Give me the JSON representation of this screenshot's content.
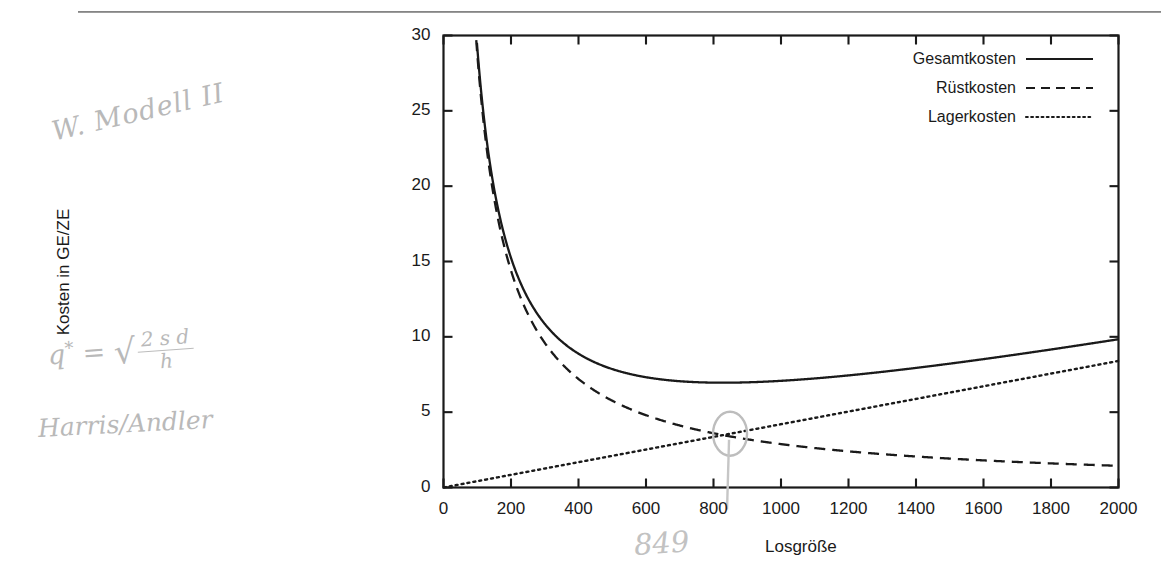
{
  "page": {
    "rule_visible": true
  },
  "annotations": {
    "model_note": "W. Modell II",
    "formula_lhs": "q",
    "formula_star": "*",
    "formula_eq": "=",
    "formula_radical": "√",
    "formula_numerator": "2 s d",
    "formula_denominator": "h",
    "authors": "Harris/Andler",
    "optimum_handwritten": "849"
  },
  "chart_data": {
    "type": "line",
    "title": "",
    "xlabel": "Losgröße",
    "ylabel": "Kosten in GE/ZE",
    "xlim": [
      0,
      2000
    ],
    "ylim": [
      0,
      30
    ],
    "xticks": [
      0,
      200,
      400,
      600,
      800,
      1000,
      1200,
      1400,
      1600,
      1800,
      2000
    ],
    "xtick_labels": [
      "0",
      "200",
      "400",
      "600",
      "800",
      "1000",
      "1200",
      "1400",
      "1600",
      "1800",
      "2000"
    ],
    "yticks": [
      0,
      5,
      10,
      15,
      20,
      25,
      30
    ],
    "ytick_labels": [
      "0",
      "5",
      "10",
      "15",
      "20",
      "25",
      "30"
    ],
    "grid": false,
    "legend_position": "top-right",
    "x": [
      100,
      200,
      300,
      400,
      500,
      600,
      700,
      800,
      849,
      900,
      1000,
      1100,
      1200,
      1300,
      1400,
      1500,
      1600,
      1700,
      1800,
      1900,
      2000
    ],
    "series": [
      {
        "name": "Gesamtkosten",
        "style": "solid",
        "color": "#1a1a1a",
        "formula": "s*d/q + h*q/2",
        "values": [
          29.22,
          15.24,
          10.86,
          8.88,
          7.86,
          7.32,
          7.05,
          6.96,
          6.96,
          6.98,
          7.08,
          7.24,
          7.44,
          7.67,
          7.94,
          8.22,
          8.52,
          8.84,
          9.16,
          9.5,
          9.84
        ]
      },
      {
        "name": "Rüstkosten",
        "style": "dashed",
        "color": "#1a1a1a",
        "formula": "s*d/q",
        "values": [
          28.8,
          14.4,
          9.6,
          7.2,
          5.76,
          4.8,
          4.11,
          3.6,
          3.39,
          3.2,
          2.88,
          2.62,
          2.4,
          2.22,
          2.06,
          1.92,
          1.8,
          1.69,
          1.6,
          1.52,
          1.44
        ]
      },
      {
        "name": "Lagerkosten",
        "style": "dotted",
        "color": "#1a1a1a",
        "formula": "h*q/2",
        "values": [
          0.42,
          0.84,
          1.26,
          1.68,
          2.1,
          2.52,
          2.94,
          3.36,
          3.57,
          3.78,
          4.2,
          4.62,
          5.04,
          5.46,
          5.88,
          6.3,
          6.72,
          7.14,
          7.56,
          7.98,
          8.4
        ]
      }
    ],
    "parameters": {
      "sd": 2880,
      "h_over_2": 0.0042
    },
    "optimum": {
      "q": 849,
      "cost": 7.13,
      "marked": true
    }
  },
  "legend": {
    "items": [
      {
        "label": "Gesamtkosten",
        "style": "solid"
      },
      {
        "label": "Rüstkosten",
        "style": "dashed"
      },
      {
        "label": "Lagerkosten",
        "style": "dotted"
      }
    ]
  }
}
